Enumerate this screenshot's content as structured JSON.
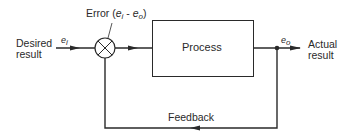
{
  "diagram": {
    "type": "feedback-control-loop",
    "input": {
      "label_line1": "Desired",
      "label_line2": "result",
      "signal": "e",
      "signal_sub": "i"
    },
    "summing_junction": {
      "error_label": "Error",
      "error_expr_open": "(",
      "error_e1": "e",
      "error_sub1": "i",
      "error_minus": " - ",
      "error_e2": "e",
      "error_sub2": "o",
      "error_expr_close": ")"
    },
    "process": {
      "label": "Process"
    },
    "output": {
      "label_line1": "Actual",
      "label_line2": "result",
      "signal": "e",
      "signal_sub": "o"
    },
    "feedback": {
      "label": "Feedback"
    },
    "colors": {
      "line": "#2a2a2a",
      "background": "#ffffff"
    }
  }
}
